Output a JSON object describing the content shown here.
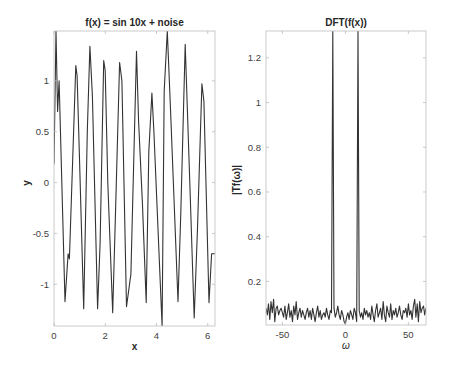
{
  "figure": {
    "background": "#ffffff",
    "line_color": "#333333",
    "frame_color": "#bdbdbd"
  },
  "chart_data": [
    {
      "type": "line",
      "title": "f(x) = sin 10x + noise",
      "xlabel": "x",
      "ylabel": "y",
      "xlim": [
        0,
        6.283
      ],
      "ylim": [
        -1.41,
        1.49
      ],
      "xticks": [
        0,
        2,
        4,
        6
      ],
      "xtick_labels": [
        "0",
        "2",
        "4",
        "6"
      ],
      "yticks": [
        -1,
        -0.5,
        0,
        0.5,
        1
      ],
      "ytick_labels": [
        "-1",
        "-0.5",
        "0",
        "0.5",
        "1"
      ],
      "grid": false,
      "series": [
        {
          "name": "f(x)",
          "x": [
            0,
            0.08,
            0.14,
            0.2,
            0.43,
            0.55,
            0.6,
            0.85,
            0.9,
            1.0,
            1.16,
            1.3,
            1.4,
            1.5,
            1.7,
            1.8,
            1.94,
            2.0,
            2.1,
            2.29,
            2.4,
            2.56,
            2.65,
            2.83,
            3.0,
            3.22,
            3.3,
            3.45,
            3.6,
            3.7,
            3.82,
            3.9,
            4.22,
            4.3,
            4.42,
            4.55,
            4.84,
            4.95,
            5.12,
            5.3,
            5.47,
            5.6,
            5.77,
            5.85,
            6.05,
            6.15,
            6.283
          ],
          "y": [
            0.18,
            1.49,
            0.7,
            1.0,
            -1.17,
            -0.7,
            -0.75,
            1.15,
            1.05,
            0.2,
            -1.24,
            0.5,
            1.34,
            0.85,
            -1.24,
            -0.6,
            1.2,
            1.1,
            0.0,
            -1.28,
            -0.3,
            1.18,
            1.0,
            -1.22,
            -0.9,
            1.29,
            0.6,
            -0.2,
            -1.18,
            0.3,
            0.88,
            0.5,
            -1.41,
            0.9,
            1.49,
            0.7,
            -1.17,
            -0.3,
            1.36,
            0.0,
            -1.33,
            -0.45,
            0.97,
            0.8,
            -1.18,
            -0.7,
            -0.7
          ]
        }
      ]
    },
    {
      "type": "line",
      "title": "DFT(f(x))",
      "xlabel": "ω",
      "ylabel": "|Tf(ω)|",
      "xlim": [
        -63,
        64
      ],
      "ylim": [
        0.005,
        1.32
      ],
      "xticks": [
        -50,
        0,
        50
      ],
      "xtick_labels": [
        "-50",
        "0",
        "50"
      ],
      "yticks": [
        0.2,
        0.4,
        0.6,
        0.8,
        1,
        1.2
      ],
      "ytick_labels": [
        "0.2",
        "0.4",
        "0.6",
        "0.8",
        "1",
        "1.2"
      ],
      "grid": false,
      "series": [
        {
          "name": "|Tf(ω)|",
          "x": [
            -63,
            -62,
            -61,
            -60,
            -59,
            -58,
            -57,
            -56,
            -55,
            -54,
            -53,
            -52,
            -51,
            -50,
            -49,
            -48,
            -47,
            -46,
            -45,
            -44,
            -43,
            -42,
            -41,
            -40,
            -39,
            -38,
            -37,
            -36,
            -35,
            -34,
            -33,
            -32,
            -31,
            -30,
            -29,
            -28,
            -27,
            -26,
            -25,
            -24,
            -23,
            -22,
            -21,
            -20,
            -19,
            -18,
            -17,
            -16,
            -15,
            -14,
            -13,
            -12,
            -11,
            -10,
            -9,
            -8,
            -7,
            -6,
            -5,
            -4,
            -3,
            -2,
            -1,
            0,
            1,
            2,
            3,
            4,
            5,
            6,
            7,
            8,
            9,
            10,
            11,
            12,
            13,
            14,
            15,
            16,
            17,
            18,
            19,
            20,
            21,
            22,
            23,
            24,
            25,
            26,
            27,
            28,
            29,
            30,
            31,
            32,
            33,
            34,
            35,
            36,
            37,
            38,
            39,
            40,
            41,
            42,
            43,
            44,
            45,
            46,
            47,
            48,
            49,
            50,
            51,
            52,
            53,
            54,
            55,
            56,
            57,
            58,
            59,
            60,
            61,
            62,
            63,
            64
          ],
          "y": [
            0.08,
            0.05,
            0.1,
            0.03,
            0.11,
            0.06,
            0.12,
            0.02,
            0.08,
            0.09,
            0.05,
            0.07,
            0.08,
            0.06,
            0.04,
            0.09,
            0.03,
            0.06,
            0.1,
            0.04,
            0.07,
            0.02,
            0.09,
            0.05,
            0.11,
            0.03,
            0.06,
            0.08,
            0.04,
            0.07,
            0.05,
            0.03,
            0.06,
            0.08,
            0.04,
            0.07,
            0.03,
            0.08,
            0.05,
            0.02,
            0.06,
            0.09,
            0.04,
            0.07,
            0.03,
            0.05,
            0.06,
            0.04,
            0.08,
            0.05,
            0.03,
            0.07,
            0.06,
            1.32,
            0.08,
            0.04,
            0.06,
            0.09,
            0.05,
            0.03,
            0.07,
            0.05,
            0.02,
            0.01,
            0.04,
            0.06,
            0.03,
            0.07,
            0.05,
            0.03,
            0.08,
            0.06,
            0.02,
            1.32,
            0.07,
            0.04,
            0.06,
            0.03,
            0.08,
            0.05,
            0.07,
            0.04,
            0.06,
            0.03,
            0.09,
            0.05,
            0.02,
            0.07,
            0.1,
            0.04,
            0.06,
            0.08,
            0.03,
            0.11,
            0.05,
            0.02,
            0.09,
            0.06,
            0.04,
            0.1,
            0.03,
            0.07,
            0.05,
            0.08,
            0.04,
            0.06,
            0.09,
            0.05,
            0.03,
            0.07,
            0.06,
            0.08,
            0.04,
            0.1,
            0.05,
            0.07,
            0.03,
            0.09,
            0.12,
            0.04,
            0.1,
            0.02,
            0.11,
            0.06,
            0.08,
            0.09,
            0.05,
            0.08
          ]
        }
      ]
    }
  ]
}
